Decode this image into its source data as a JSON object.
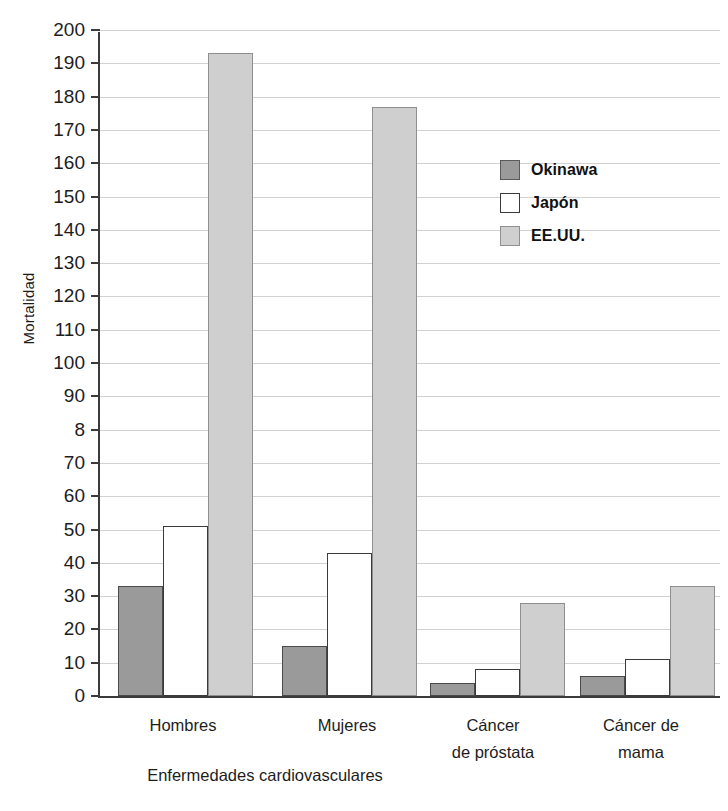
{
  "chart_data": {
    "type": "bar",
    "title": "",
    "xlabel": "",
    "ylabel": "Mortalidad",
    "ylim": [
      0,
      200
    ],
    "ytick_labels": [
      "200",
      "190",
      "180",
      "170",
      "160",
      "150",
      "140",
      "130",
      "120",
      "110",
      "100",
      "90",
      "8",
      "70",
      "60",
      "50",
      "40",
      "30",
      "20",
      "10",
      "0"
    ],
    "ytick_values": [
      200,
      190,
      180,
      170,
      160,
      150,
      140,
      130,
      120,
      110,
      100,
      90,
      80,
      70,
      60,
      50,
      40,
      30,
      20,
      10,
      0
    ],
    "grid": true,
    "legend_position": "upper right",
    "categories": [
      "Hombres",
      "Mujeres",
      "Cáncer de próstata",
      "Cáncer de mama"
    ],
    "category_labels": [
      {
        "line1": "Hombres",
        "line2": ""
      },
      {
        "line1": "Mujeres",
        "line2": ""
      },
      {
        "line1": "Cáncer",
        "line2": "de próstata"
      },
      {
        "line1": "Cáncer de",
        "line2": "mama"
      }
    ],
    "group_labels": [
      {
        "text": "Enfermedades cardiovasculares",
        "spans": [
          "Hombres",
          "Mujeres"
        ]
      }
    ],
    "series": [
      {
        "name": "Okinawa",
        "color": "#9a9a9a",
        "values": [
          33,
          15,
          4,
          6
        ]
      },
      {
        "name": "Japón",
        "color": "#ffffff",
        "values": [
          51,
          43,
          8,
          11
        ]
      },
      {
        "name": "EE.UU.",
        "color": "#cfcfcf",
        "values": [
          193,
          177,
          28,
          33
        ]
      }
    ]
  },
  "legend": {
    "items": [
      {
        "label": "Okinawa",
        "key": "okinawa"
      },
      {
        "label": "Japón",
        "key": "japon"
      },
      {
        "label": "EE.UU.",
        "key": "eeuu"
      }
    ]
  },
  "axis": {
    "y_title": "Mortalidad"
  }
}
